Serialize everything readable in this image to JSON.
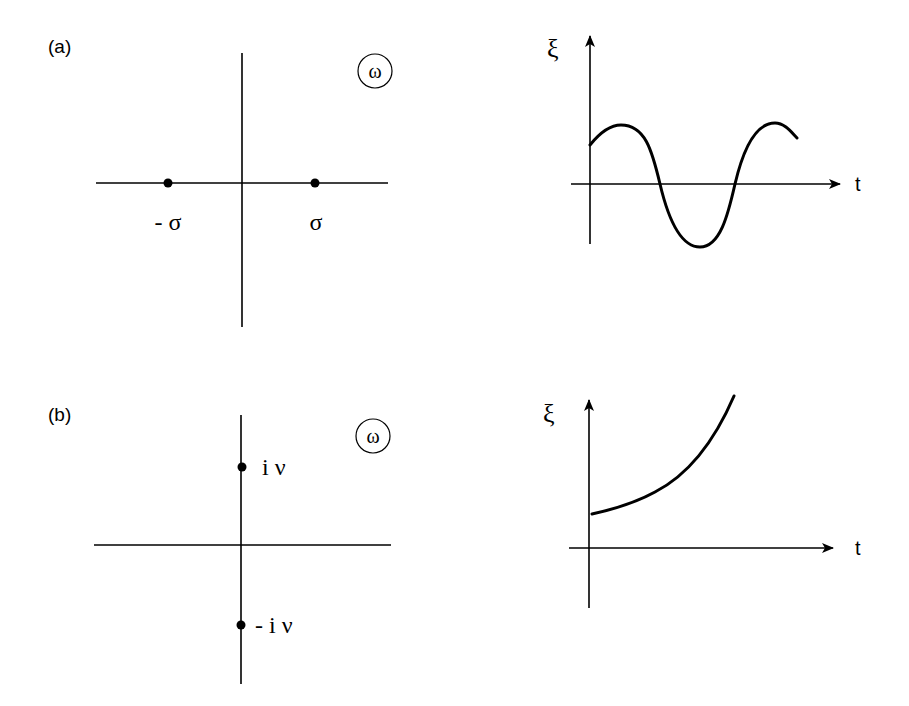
{
  "panels": [
    {
      "label": "(a)",
      "plane_symbol": "ω",
      "roots": [
        {
          "label": "- σ",
          "position": "real-negative"
        },
        {
          "label": "σ",
          "position": "real-positive"
        }
      ],
      "time_plot": {
        "y_label": "ξ",
        "x_label": "t",
        "behavior": "oscillating"
      }
    },
    {
      "label": "(b)",
      "plane_symbol": "ω",
      "roots": [
        {
          "label": "i ν",
          "position": "imag-positive"
        },
        {
          "label": "- i ν",
          "position": "imag-negative"
        }
      ],
      "time_plot": {
        "y_label": "ξ",
        "x_label": "t",
        "behavior": "exponential-growth"
      }
    }
  ],
  "colors": {
    "ink": "#000000",
    "background": "#ffffff"
  }
}
